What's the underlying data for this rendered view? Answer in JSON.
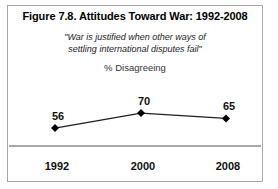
{
  "figure": {
    "title": "Figure 7.8. Attitudes Toward War: 1992-2008",
    "quote_line1": "\"War is justified when other ways of",
    "quote_line2": "settling international disputes fail\"",
    "measure_label": "% Disagreeing"
  },
  "chart_data": {
    "type": "line",
    "categories": [
      "1992",
      "2000",
      "2008"
    ],
    "values": [
      56,
      70,
      65
    ],
    "title": "Figure 7.8. Attitudes Toward War: 1992-2008",
    "subtitle": "\"War is justified when other ways of settling international disputes fail\"",
    "xlabel": "",
    "ylabel": "% Disagreeing",
    "ylim": [
      40,
      80
    ],
    "grid": false,
    "legend": false,
    "marker": "diamond",
    "data_labels": true,
    "line_color": "#1f1f1f",
    "marker_color": "#000000",
    "axis_line_color": "#8c8c8c"
  },
  "colors": {
    "frame_border": "#a8a8a8",
    "background": "#ffffff",
    "text": "#000000"
  }
}
